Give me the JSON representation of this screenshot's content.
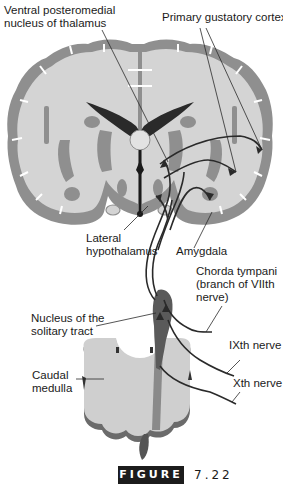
{
  "diagram": {
    "type": "anatomical",
    "labels": {
      "vpm_line1": "Ventral posteromedial",
      "vpm_line2": "nucleus of thalamus",
      "gustatory_cortex": "Primary gustatory cortex",
      "lateral_hypo_line1": "Lateral",
      "lateral_hypo_line2": "hypothalamus",
      "amygdala": "Amygdala",
      "chorda_line1": "Chorda tympani",
      "chorda_line2": "(branch of VIIth",
      "chorda_line3": "nerve)",
      "nts_line1": "Nucleus of the",
      "nts_line2": "solitary tract",
      "ixth": "IXth nerve",
      "caudal_line1": "Caudal",
      "caudal_line2": "medulla",
      "xth": "Xth nerve"
    },
    "figure": {
      "tag": "FIGURE",
      "number": "7.22"
    },
    "colors": {
      "cortex_gray": "#8f8f8f",
      "white_matter": "#d4d4d4",
      "ventricle": "#2a2a2a",
      "pathway": "#2a2a2a",
      "nts_dark": "#5a5a5a",
      "medulla_fill": "#cfcfcf"
    }
  }
}
